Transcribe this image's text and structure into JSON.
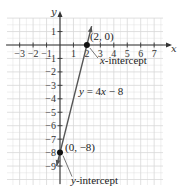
{
  "chart_data": {
    "type": "line",
    "title": "",
    "xlabel": "x",
    "ylabel": "y",
    "xlim": [
      -4,
      7.7
    ],
    "ylim": [
      -10,
      2
    ],
    "grid": true,
    "x_ticks": [
      "-3",
      "-2",
      "-1",
      "1",
      "2",
      "3",
      "4",
      "5",
      "6",
      "7"
    ],
    "y_ticks": [
      "1",
      "-1",
      "-2",
      "-3",
      "-4",
      "-5",
      "-6",
      "-7",
      "-8",
      "-9"
    ],
    "series": [
      {
        "name": "y = 4x - 8",
        "x": [
          -0.25,
          2.35
        ],
        "y": [
          -9,
          1.4
        ]
      }
    ],
    "points": [
      {
        "x": 2,
        "y": 0,
        "label": "(2, 0)",
        "annotation": "x-intercept"
      },
      {
        "x": 0,
        "y": -8,
        "label": "(0, −8)",
        "annotation": "y-intercept"
      }
    ],
    "equation_label": "y = 4x − 8",
    "colors": {
      "line": "#555555",
      "axis": "#333333",
      "grid": "#d8d8d8",
      "point": "#111111"
    }
  }
}
